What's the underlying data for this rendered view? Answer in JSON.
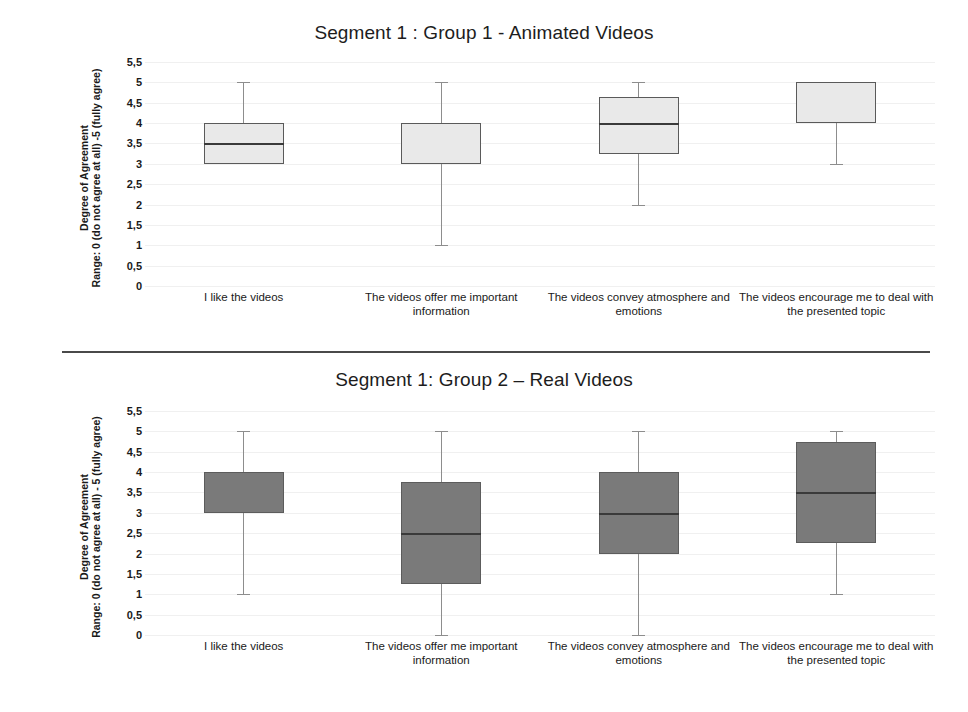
{
  "chart_data": [
    {
      "type": "box",
      "title": "Segment 1 : Group 1 - Animated Videos",
      "xlabel": "",
      "ylabel": "Degree of Agreement",
      "ylabel_line2": "Range: 0 (do not agree at all) -5 (fully agree)",
      "ylim": [
        0,
        5.5
      ],
      "yticks": [
        "0",
        "0,5",
        "1",
        "1,5",
        "2",
        "2,5",
        "3",
        "3,5",
        "4",
        "4,5",
        "5",
        "5,5"
      ],
      "ytick_values": [
        0,
        0.5,
        1,
        1.5,
        2,
        2.5,
        3,
        3.5,
        4,
        4.5,
        5,
        5.5
      ],
      "grid": true,
      "legend": "none",
      "box_fill": "#e9e9e9",
      "box_edge": "#5a5a5a",
      "categories": [
        "I like the videos",
        "The videos offer me important information",
        "The videos convey atmosphere and emotions",
        "The videos encourage me to deal with the presented topic"
      ],
      "boxes": [
        {
          "label": "I like the videos",
          "whisker_low": 3,
          "q1": 3,
          "median": 3.5,
          "q3": 4,
          "whisker_high": 5
        },
        {
          "label": "The videos offer me important information",
          "whisker_low": 1,
          "q1": 3,
          "median": 4,
          "q3": 4,
          "whisker_high": 5
        },
        {
          "label": "The videos convey atmosphere and emotions",
          "whisker_low": 2,
          "q1": 3.25,
          "median": 4,
          "q3": 4.65,
          "whisker_high": 5
        },
        {
          "label": "The videos encourage me to deal with the presented topic",
          "whisker_low": 3,
          "q1": 4,
          "median": 5,
          "q3": 5,
          "whisker_high": 5
        }
      ]
    },
    {
      "type": "box",
      "title": "Segment 1: Group 2 – Real Videos",
      "xlabel": "",
      "ylabel": "Degree of Agreement",
      "ylabel_line2": "Range: 0 (do not agree at all) - 5 (fully agree)",
      "ylim": [
        0,
        5.5
      ],
      "yticks": [
        "0",
        "0,5",
        "1",
        "1,5",
        "2",
        "2,5",
        "3",
        "3,5",
        "4",
        "4,5",
        "5",
        "5,5"
      ],
      "ytick_values": [
        0,
        0.5,
        1,
        1.5,
        2,
        2.5,
        3,
        3.5,
        4,
        4.5,
        5,
        5.5
      ],
      "grid": true,
      "legend": "none",
      "box_fill": "#7a7a7a",
      "box_edge": "#5c5c5c",
      "categories": [
        "I like the videos",
        "The videos offer me important information",
        "The videos convey atmosphere and emotions",
        "The videos encourage me to deal with the presented topic"
      ],
      "boxes": [
        {
          "label": "I like the videos",
          "whisker_low": 1,
          "q1": 3,
          "median": 4,
          "q3": 4,
          "whisker_high": 5
        },
        {
          "label": "The videos offer me important information",
          "whisker_low": 0,
          "q1": 1.25,
          "median": 2.5,
          "q3": 3.75,
          "whisker_high": 5
        },
        {
          "label": "The videos convey atmosphere and emotions",
          "whisker_low": 0,
          "q1": 2,
          "median": 3,
          "q3": 4,
          "whisker_high": 5
        },
        {
          "label": "The videos encourage me to deal with the presented topic",
          "whisker_low": 1,
          "q1": 2.25,
          "median": 3.5,
          "q3": 4.75,
          "whisker_high": 5
        }
      ]
    }
  ]
}
